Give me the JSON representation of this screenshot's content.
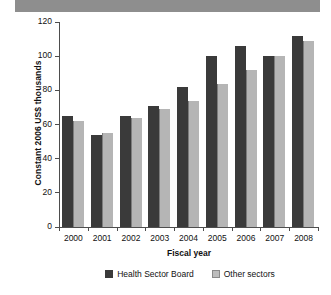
{
  "figure": {
    "title_banner_present": true,
    "background": "#ffffff"
  },
  "chart_data": {
    "type": "bar",
    "title": "",
    "xlabel": "Fiscal year",
    "ylabel": "Constant 2006 US$ thousands",
    "categories": [
      "2000",
      "2001",
      "2002",
      "2003",
      "2004",
      "2005",
      "2006",
      "2007",
      "2008"
    ],
    "series": [
      {
        "name": "Health Sector Board",
        "color": "#3a3a3a",
        "values": [
          65,
          54,
          65,
          71,
          82,
          100,
          106,
          100,
          112
        ]
      },
      {
        "name": "Other sectors",
        "color": "#b5b5b5",
        "values": [
          62,
          55,
          64,
          69,
          74,
          84,
          92,
          100,
          109
        ]
      }
    ],
    "ylim": [
      0,
      120
    ],
    "yticks": [
      0,
      20,
      40,
      60,
      80,
      100,
      120
    ],
    "ytick_labels": [
      "0",
      "20",
      "40",
      "60",
      "80",
      "100",
      "120"
    ],
    "grid": false,
    "legend_position": "bottom"
  },
  "legend": {
    "items": [
      {
        "label": "Health Sector Board",
        "swatch": "dark"
      },
      {
        "label": "Other sectors",
        "swatch": "light"
      }
    ]
  }
}
